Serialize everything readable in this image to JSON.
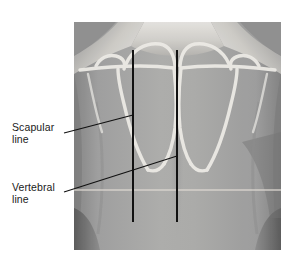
{
  "figure": {
    "type": "anatomical-illustration",
    "background_color": "#ffffff",
    "plate": {
      "x": 74,
      "y": 22,
      "width": 207,
      "height": 228,
      "skin_midtone": "#9b9b9b",
      "skin_highlight": "#d8d6d2",
      "skin_shadow": "#6d6d6d",
      "bone_outline_color": "#e9e7e2"
    }
  },
  "labels": [
    {
      "id": "scapular",
      "text": "Scapular\nline",
      "x": 12,
      "y": 122,
      "leader": {
        "x1": 64,
        "y1": 133,
        "x2": 133,
        "y2": 115
      }
    },
    {
      "id": "vertebral",
      "text": "Vertebral\nline",
      "x": 12,
      "y": 182,
      "leader": {
        "x1": 64,
        "y1": 192,
        "x2": 177,
        "y2": 156
      }
    }
  ],
  "reference_lines": [
    {
      "id": "scapular-line",
      "name": "Scapular line",
      "color": "#111111",
      "x": 133,
      "y_top": 50,
      "y_bottom": 222,
      "width": 2
    },
    {
      "id": "vertebral-line",
      "name": "Vertebral line",
      "color": "#111111",
      "x": 177,
      "y_top": 50,
      "y_bottom": 222,
      "width": 2
    }
  ],
  "horizontal_marker": {
    "id": "inferior-angle-marker",
    "color": "#ded9d2",
    "y": 190,
    "x1": 74,
    "x2": 281
  },
  "scapulae": [
    {
      "side": "left",
      "outline_color": "#e9e7e2"
    },
    {
      "side": "right",
      "outline_color": "#e9e7e2"
    }
  ]
}
